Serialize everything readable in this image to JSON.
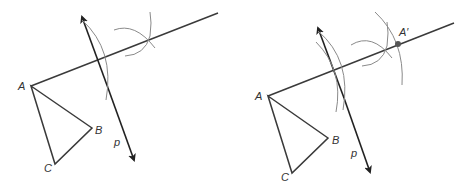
{
  "diagram": {
    "panels": [
      {
        "id": "left",
        "labels": {
          "A": "A",
          "B": "B",
          "C": "C",
          "p": "p"
        },
        "points": {
          "A": [
            31,
            86
          ],
          "B": [
            92,
            128
          ],
          "C": [
            55,
            164
          ]
        },
        "ray_end": [
          218,
          13
        ],
        "p_line": {
          "start": [
            82,
            17
          ],
          "end": [
            134,
            160
          ]
        }
      },
      {
        "id": "right",
        "labels": {
          "A": "A",
          "B": "B",
          "C": "C",
          "p": "p",
          "A_prime": "A′"
        },
        "points": {
          "A": [
            268,
            96
          ],
          "B": [
            328,
            138
          ],
          "C": [
            292,
            173
          ],
          "A_prime": [
            398,
            44
          ]
        },
        "ray_end": [
          454,
          23
        ],
        "p_line": {
          "start": [
            318,
            28
          ],
          "end": [
            370,
            172
          ]
        }
      }
    ],
    "colors": {
      "line": "#3a3a3a",
      "arc": "#8a8a8a",
      "point": "#555555"
    }
  }
}
